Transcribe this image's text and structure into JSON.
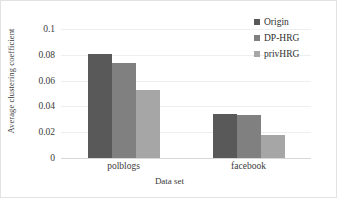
{
  "chart_data": {
    "type": "bar",
    "title": "",
    "xlabel": "Data set",
    "ylabel": "Average clustering coefficient",
    "categories": [
      "polblogs",
      "facebook"
    ],
    "series": [
      {
        "name": "Origin",
        "color": "#595959",
        "values": [
          0.081,
          0.034
        ]
      },
      {
        "name": "DP-HRG",
        "color": "#808080",
        "values": [
          0.0735,
          0.033
        ]
      },
      {
        "name": "privHRG",
        "color": "#a6a6a6",
        "values": [
          0.053,
          0.018
        ]
      }
    ],
    "ylim": [
      0,
      0.1
    ],
    "yticks": [
      "0",
      "0.02",
      "0.04",
      "0.06",
      "0.08",
      "0.1"
    ],
    "ytick_values": [
      0,
      0.02,
      0.04,
      0.06,
      0.08,
      0.1
    ],
    "grid": true,
    "legend_position": "top-right"
  }
}
